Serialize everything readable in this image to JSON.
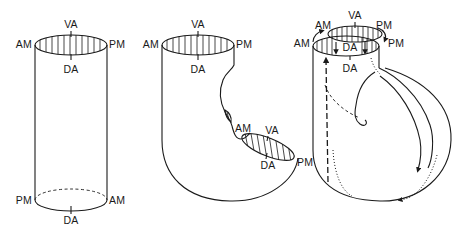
{
  "figure": {
    "panels": [
      {
        "id": "straight-tube",
        "top_labels": {
          "ventral": "VA",
          "anterior_margin": "AM",
          "posterior_margin": "PM",
          "dorsal": "DA"
        },
        "bottom_labels": {
          "posterior_margin": "PM",
          "anterior_margin": "AM",
          "dorsal": "DA"
        }
      },
      {
        "id": "bent-tube",
        "top_labels": {
          "ventral": "VA",
          "anterior_margin": "AM",
          "posterior_margin": "PM",
          "dorsal": "DA"
        },
        "second_opening_labels": {
          "anterior_margin": "AM",
          "ventral": "VA",
          "dorsal": "DA",
          "posterior_margin": "PM"
        }
      },
      {
        "id": "folded-tube",
        "outer_labels": {
          "anterior_margin": "AM",
          "ventral": "VA",
          "posterior_margin": "PM"
        },
        "inner_labels": {
          "anterior_margin": "AM",
          "dorsal_inner": "DA",
          "posterior_margin": "PM",
          "dorsal": "DA"
        }
      }
    ]
  },
  "colors": {
    "ink": "#1a1a1a",
    "background": "#ffffff"
  }
}
